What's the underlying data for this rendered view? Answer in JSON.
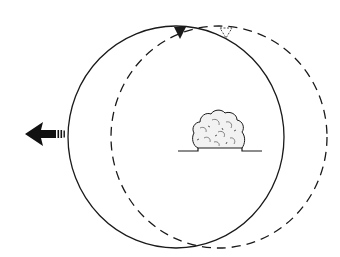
{
  "diagram": {
    "type": "orbit-displacement-illustration",
    "colors": {
      "background": "#ffffff",
      "stroke": "#1a1a1a",
      "cloud_fill": "#f2f2f2"
    },
    "elements": {
      "solid_orbit": {
        "style": "solid",
        "cx": 176,
        "cy": 137,
        "rx": 108,
        "ry": 111
      },
      "dashed_orbit": {
        "style": "dashed",
        "cx": 219,
        "cy": 137,
        "rx": 108,
        "ry": 111
      },
      "direction_arrow": {
        "direction": "left",
        "style": "filled-with-motion-lines"
      },
      "solid_marker": {
        "shape": "filled-triangle-down"
      },
      "dashed_marker": {
        "shape": "outline-triangle-down"
      },
      "cloud": {
        "shape": "mushroom-cloud-dome"
      },
      "ground_line": {
        "shape": "horizontal-line"
      }
    }
  }
}
